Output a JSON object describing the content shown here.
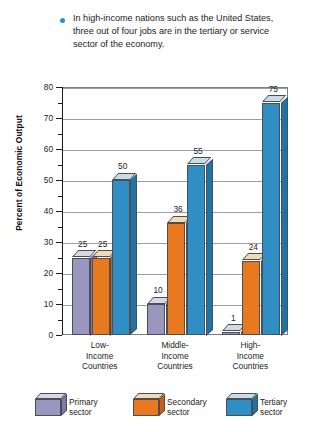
{
  "caption": {
    "bullet_color": "#2b8fc0",
    "text": "In high-income nations such as the United States, three out of four jobs are in the tertiary or service sector of the economy."
  },
  "chart_data": {
    "type": "bar",
    "title": "",
    "xlabel": "",
    "ylabel": "Percent of Economic Output",
    "ylim": [
      0,
      80
    ],
    "ytick_step": 10,
    "yticks": [
      "0",
      "10",
      "20",
      "30",
      "40",
      "50",
      "60",
      "70",
      "80"
    ],
    "grid": true,
    "legend_position": "bottom",
    "categories": [
      "Low-\nIncome\nCountries",
      "Middle-\nIncome\nCountries",
      "High-\nIncome\nCountries"
    ],
    "category_lines": [
      [
        "Low-",
        "Income",
        "Countries"
      ],
      [
        "Middle-",
        "Income",
        "Countries"
      ],
      [
        "High-",
        "Income",
        "Countries"
      ]
    ],
    "series": [
      {
        "name": "Primary sector",
        "color": "#9a96bd",
        "top_color": "#d9d7e6",
        "side_color": "#7e7aa3",
        "values": [
          25,
          10,
          1
        ]
      },
      {
        "name": "Secondary sector",
        "color": "#e8791e",
        "top_color": "#f3d9b6",
        "side_color": "#c95f12",
        "values": [
          25,
          36,
          24
        ]
      },
      {
        "name": "Tertiary sector",
        "color": "#2f8fc4",
        "top_color": "#c6dce8",
        "side_color": "#1f74a6",
        "values": [
          50,
          55,
          75
        ]
      }
    ]
  },
  "legend": {
    "items": [
      {
        "label_line1": "Primary",
        "label_line2": "sector",
        "color": "#9a96bd"
      },
      {
        "label_line1": "Secondary",
        "label_line2": "sector",
        "color": "#e8791e"
      },
      {
        "label_line1": "Tertiary",
        "label_line2": "sector",
        "color": "#2f8fc4"
      }
    ]
  }
}
